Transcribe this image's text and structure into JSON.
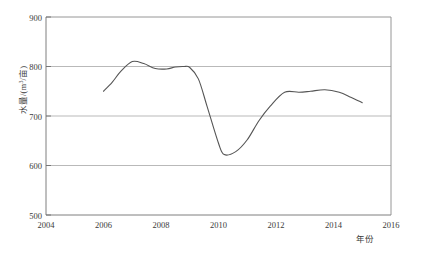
{
  "chart_data": {
    "type": "line",
    "title": "",
    "xlabel": "年份",
    "ylabel": "水量/(m³/亩)",
    "ylabel_parts": {
      "prefix": "水量/(m",
      "sup": "3",
      "suffix": "/亩)"
    },
    "xlim": [
      2004,
      2016
    ],
    "ylim": [
      500,
      900
    ],
    "xticks": [
      2004,
      2006,
      2008,
      2010,
      2012,
      2014,
      2016
    ],
    "xtick_labels": [
      "2004",
      "2006",
      "2008",
      "2010",
      "2012",
      "2014",
      "2016"
    ],
    "yticks": [
      500,
      600,
      700,
      800,
      900
    ],
    "ytick_labels": [
      "500",
      "600",
      "700",
      "800",
      "900"
    ],
    "grid": "horizontal",
    "legend": null,
    "series": [
      {
        "name": "水量",
        "color": "#555555",
        "x": [
          2006.0,
          2006.3,
          2006.6,
          2007.0,
          2007.4,
          2007.8,
          2008.2,
          2008.5,
          2008.8,
          2009.0,
          2009.3,
          2009.6,
          2010.0,
          2010.2,
          2010.6,
          2011.0,
          2011.4,
          2011.8,
          2012.3,
          2012.8,
          2013.2,
          2013.7,
          2014.2,
          2014.6,
          2015.0
        ],
        "y": [
          750,
          768,
          790,
          810,
          806,
          796,
          795,
          799,
          800,
          798,
          775,
          720,
          645,
          622,
          628,
          652,
          690,
          720,
          748,
          748,
          750,
          753,
          748,
          738,
          727
        ]
      }
    ],
    "annotations": []
  },
  "axes": {
    "y_axis_name": "y-axis",
    "x_axis_name": "x-axis"
  }
}
